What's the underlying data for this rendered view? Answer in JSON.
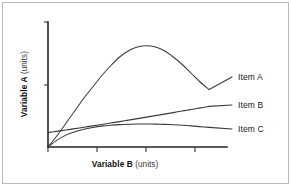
{
  "figure": {
    "background_color": "#ffffff",
    "border_color": "#b9b9b9",
    "axis_color": "#222222",
    "curve_color": "#3a3a3a"
  },
  "axes": {
    "x_title_bold": "Variable B",
    "x_title_light": "(units)",
    "y_title_bold": "Variable A",
    "y_title_light": "(units)"
  },
  "legend": {
    "item_a": "Item A",
    "item_b": "Item B",
    "item_c": "Item C"
  },
  "chart_data": {
    "type": "line",
    "title": "",
    "subtitle": "",
    "xlabel": "Variable B (units)",
    "ylabel": "Variable A (units)",
    "xlim": [
      0,
      10
    ],
    "ylim": [
      0,
      10
    ],
    "grid": false,
    "x_tick_labels": [
      "",
      "",
      "",
      ""
    ],
    "y_tick_labels": [
      "",
      ""
    ],
    "legend_position": "right-inline",
    "annotations": [
      "Item A rises steeply, peaks near x=5.3, then declines",
      "Item B rises linearly from a small positive intercept",
      "Item C rises and saturates, then flattens slightly downward"
    ],
    "x": [
      0,
      0.5,
      1,
      1.5,
      2,
      2.5,
      3,
      3.5,
      4,
      4.5,
      5,
      5.5,
      6,
      6.5,
      7,
      7.5,
      8,
      8.5,
      9
    ],
    "series": [
      {
        "name": "Item A",
        "color": "#3a3a3a",
        "values": [
          0.0,
          0.9,
          1.9,
          2.9,
          3.9,
          4.8,
          5.7,
          6.5,
          7.2,
          7.7,
          8.0,
          8.1,
          8.0,
          7.7,
          7.2,
          6.6,
          5.9,
          5.2,
          4.6
        ]
      },
      {
        "name": "Item B",
        "color": "#3a3a3a",
        "values": [
          1.15,
          1.25,
          1.36,
          1.47,
          1.58,
          1.69,
          1.8,
          1.92,
          2.03,
          2.15,
          2.27,
          2.39,
          2.51,
          2.63,
          2.75,
          2.88,
          3.0,
          3.13,
          3.25
        ]
      },
      {
        "name": "Item C",
        "color": "#3a3a3a",
        "values": [
          0.0,
          0.55,
          0.95,
          1.22,
          1.42,
          1.56,
          1.67,
          1.74,
          1.79,
          1.82,
          1.84,
          1.84,
          1.83,
          1.81,
          1.78,
          1.74,
          1.69,
          1.63,
          1.57
        ]
      }
    ]
  }
}
